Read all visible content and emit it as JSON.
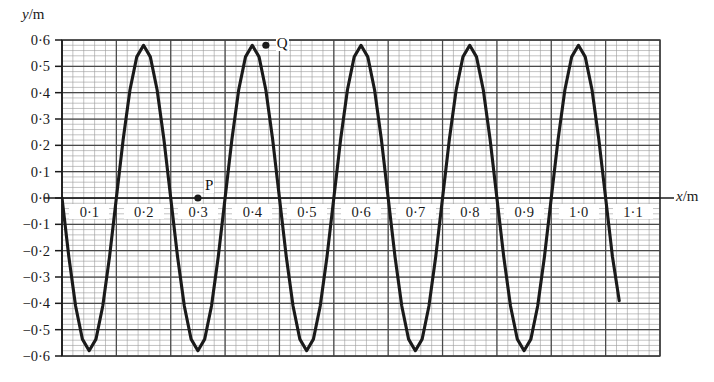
{
  "figure": {
    "type": "line-graph"
  },
  "axes": {
    "y_title": "y",
    "y_unit": "/m",
    "x_title": "x",
    "x_unit": "/m",
    "y_ticks": [
      "0·6",
      "0·5",
      "0·4",
      "0·3",
      "0·2",
      "0·1",
      "0·0",
      "−0·1",
      "−0·2",
      "−0·3",
      "−0·4",
      "−0·5",
      "−0·6"
    ],
    "x_ticks": [
      "0·1",
      "0·2",
      "0·3",
      "0·4",
      "0·5",
      "0·6",
      "0·7",
      "0·8",
      "0·9",
      "1·0",
      "1·1"
    ]
  },
  "annotations": [
    {
      "label": "P",
      "x": 0.25,
      "y": 0.0
    },
    {
      "label": "Q",
      "x": 0.375,
      "y": 0.58
    }
  ],
  "colors": {
    "curve": "#1a1a1a",
    "axis": "#1a1a1a",
    "grid_major": "#4a4a4a",
    "grid_minor": "#9a9a9a",
    "background": "#ffffff"
  },
  "chart_data": {
    "type": "line",
    "title": "",
    "xlabel": "x/m",
    "ylabel": "y/m",
    "xlim": [
      0.0,
      1.1
    ],
    "ylim": [
      -0.6,
      0.6
    ],
    "grid": true,
    "legend": "none",
    "x_tick_values": [
      0.1,
      0.2,
      0.3,
      0.4,
      0.5,
      0.6,
      0.7,
      0.8,
      0.9,
      1.0,
      1.1
    ],
    "y_tick_values": [
      0.6,
      0.5,
      0.4,
      0.3,
      0.2,
      0.1,
      0.0,
      -0.1,
      -0.2,
      -0.3,
      -0.4,
      -0.5,
      -0.6
    ],
    "wave": {
      "form": "y = -A*sin(2*pi*x/wavelength)",
      "amplitude": 0.58,
      "wavelength": 0.25,
      "x_start": 0.0,
      "x_end": 1.025
    },
    "series": [
      {
        "name": "displacement",
        "x": [
          0.0,
          0.0125,
          0.025,
          0.0375,
          0.05,
          0.0625,
          0.075,
          0.0875,
          0.1,
          0.1125,
          0.125,
          0.1375,
          0.15,
          0.1625,
          0.175,
          0.1875,
          0.2,
          0.2125,
          0.225,
          0.2375,
          0.25,
          0.2625,
          0.275,
          0.2875,
          0.3,
          0.3125,
          0.325,
          0.3375,
          0.35,
          0.3625,
          0.375,
          0.3875,
          0.4,
          0.4125,
          0.425,
          0.4375,
          0.45,
          0.4625,
          0.475,
          0.4875,
          0.5,
          0.5125,
          0.525,
          0.5375,
          0.55,
          0.5625,
          0.575,
          0.5875,
          0.6,
          0.6125,
          0.625,
          0.6375,
          0.65,
          0.6625,
          0.675,
          0.6875,
          0.7,
          0.7125,
          0.725,
          0.7375,
          0.75,
          0.7625,
          0.775,
          0.7875,
          0.8,
          0.8125,
          0.825,
          0.8375,
          0.85,
          0.8625,
          0.875,
          0.8875,
          0.9,
          0.9125,
          0.925,
          0.9375,
          0.95,
          0.9625,
          0.975,
          0.9875,
          1.0,
          1.0125,
          1.025
        ],
        "y": [
          0.0,
          -0.222,
          -0.41,
          -0.536,
          -0.58,
          -0.536,
          -0.41,
          -0.222,
          0.0,
          0.222,
          0.41,
          0.536,
          0.58,
          0.536,
          0.41,
          0.222,
          0.0,
          -0.222,
          -0.41,
          -0.536,
          -0.58,
          -0.536,
          -0.41,
          -0.222,
          0.0,
          0.222,
          0.41,
          0.536,
          0.58,
          0.536,
          0.41,
          0.222,
          0.0,
          -0.222,
          -0.41,
          -0.536,
          -0.58,
          -0.536,
          -0.41,
          -0.222,
          0.0,
          0.222,
          0.41,
          0.536,
          0.58,
          0.536,
          0.41,
          0.222,
          0.0,
          -0.222,
          -0.41,
          -0.536,
          -0.58,
          -0.536,
          -0.41,
          -0.222,
          0.0,
          0.222,
          0.41,
          0.536,
          0.58,
          0.536,
          0.41,
          0.222,
          0.0,
          -0.222,
          -0.41,
          -0.536,
          -0.58,
          -0.536,
          -0.41,
          -0.222,
          0.0,
          0.222,
          0.41,
          0.536,
          0.58,
          0.536,
          0.41,
          0.222,
          0.0,
          -0.222,
          -0.39
        ]
      }
    ],
    "annotated_points": [
      {
        "label": "P",
        "x": 0.25,
        "y": 0.0
      },
      {
        "label": "Q",
        "x": 0.375,
        "y": 0.58
      }
    ]
  }
}
